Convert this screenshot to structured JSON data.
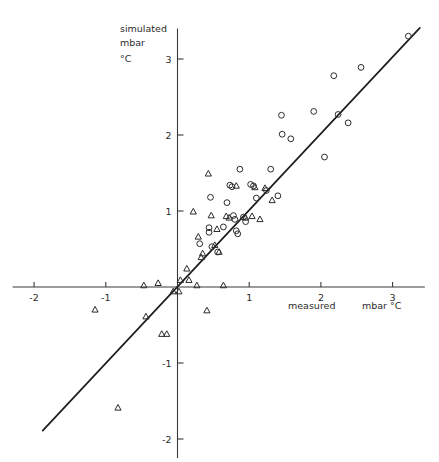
{
  "chart_data": {
    "type": "scatter",
    "title": "",
    "xlabel": "measured   mbar °C",
    "ylabel": "simulated mbar °C",
    "ylabel_lines": [
      "simulated",
      "mbar",
      "°C"
    ],
    "xlabel_parts": [
      "measured",
      "mbar °C"
    ],
    "xlim": [
      -2.3,
      3.45
    ],
    "ylim": [
      -2.25,
      3.4
    ],
    "xticks": [
      -2,
      -1,
      1,
      2,
      3
    ],
    "xtick_labels": [
      "-2",
      "-1",
      "1",
      "2",
      "3"
    ],
    "yticks": [
      3,
      2,
      1,
      -1,
      -2
    ],
    "ytick_labels": [
      "3",
      "2",
      "1",
      "-1",
      "-2"
    ],
    "grid": false,
    "legend": null,
    "reference_line": {
      "name": "one-to-one-fit-line",
      "x_start": -1.88,
      "y_start": -1.89,
      "x_end": 3.38,
      "y_end": 3.41,
      "style": "solid"
    },
    "series": [
      {
        "name": "circles",
        "marker": "circle",
        "color": "#2b2b2b",
        "points": [
          [
            0.31,
            0.57
          ],
          [
            0.44,
            0.78
          ],
          [
            0.44,
            0.72
          ],
          [
            0.46,
            1.18
          ],
          [
            0.48,
            0.53
          ],
          [
            0.56,
            0.46
          ],
          [
            0.64,
            0.79
          ],
          [
            0.69,
            1.11
          ],
          [
            0.73,
            1.34
          ],
          [
            0.76,
            1.32
          ],
          [
            0.78,
            0.94
          ],
          [
            0.8,
            0.89
          ],
          [
            0.82,
            0.74
          ],
          [
            0.84,
            0.7
          ],
          [
            0.87,
            1.55
          ],
          [
            0.92,
            0.92
          ],
          [
            0.95,
            0.86
          ],
          [
            1.02,
            1.35
          ],
          [
            1.06,
            1.33
          ],
          [
            1.1,
            1.17
          ],
          [
            1.24,
            1.27
          ],
          [
            1.3,
            1.55
          ],
          [
            1.4,
            1.2
          ],
          [
            1.45,
            2.26
          ],
          [
            1.46,
            2.01
          ],
          [
            1.58,
            1.95
          ],
          [
            1.9,
            2.31
          ],
          [
            2.05,
            1.71
          ],
          [
            2.18,
            2.78
          ],
          [
            2.24,
            2.27
          ],
          [
            2.38,
            2.16
          ],
          [
            2.56,
            2.89
          ],
          [
            3.22,
            3.3
          ]
        ]
      },
      {
        "name": "triangles",
        "marker": "triangle",
        "color": "#2b2b2b",
        "points": [
          [
            -1.15,
            -0.3
          ],
          [
            -0.83,
            -1.59
          ],
          [
            -0.47,
            0.02
          ],
          [
            -0.44,
            -0.39
          ],
          [
            -0.27,
            0.05
          ],
          [
            -0.22,
            -0.62
          ],
          [
            -0.15,
            -0.62
          ],
          [
            -0.06,
            -0.06
          ],
          [
            0.02,
            -0.06
          ],
          [
            0.04,
            0.09
          ],
          [
            0.13,
            0.24
          ],
          [
            0.16,
            0.09
          ],
          [
            0.22,
            0.99
          ],
          [
            0.27,
            0.02
          ],
          [
            0.29,
            0.66
          ],
          [
            0.33,
            0.39
          ],
          [
            0.35,
            0.44
          ],
          [
            0.41,
            -0.31
          ],
          [
            0.43,
            1.49
          ],
          [
            0.47,
            0.94
          ],
          [
            0.52,
            0.55
          ],
          [
            0.55,
            0.76
          ],
          [
            0.58,
            0.46
          ],
          [
            0.64,
            0.02
          ],
          [
            0.68,
            0.93
          ],
          [
            0.72,
            0.91
          ],
          [
            0.82,
            1.33
          ],
          [
            0.95,
            0.91
          ],
          [
            1.04,
            0.93
          ],
          [
            1.08,
            1.31
          ],
          [
            1.15,
            0.89
          ],
          [
            1.22,
            1.3
          ],
          [
            1.32,
            1.14
          ]
        ]
      }
    ]
  }
}
